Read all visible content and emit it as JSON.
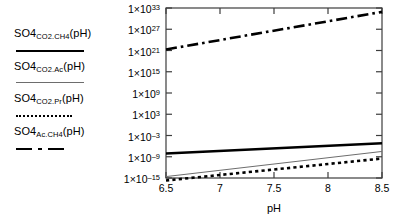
{
  "chart_data": {
    "type": "line",
    "title": "",
    "xlabel": "pH",
    "ylabel": "",
    "xlim": [
      6.5,
      8.5
    ],
    "ylim": [
      -15,
      33
    ],
    "yscale": "log",
    "grid": false,
    "legend_position": "left-outside",
    "x_ticks": [
      "6.5",
      "7",
      "7.5",
      "8",
      "8.5"
    ],
    "x_tick_values": [
      6.5,
      7,
      7.5,
      8,
      8.5
    ],
    "y_ticks": [
      {
        "mantissa": "1×10",
        "exponent": "33",
        "value": 33
      },
      {
        "mantissa": "1×10",
        "exponent": "27",
        "value": 27
      },
      {
        "mantissa": "1×10",
        "exponent": "21",
        "value": 21
      },
      {
        "mantissa": "1×10",
        "exponent": "15",
        "value": 15
      },
      {
        "mantissa": "1×10",
        "exponent": "9",
        "value": 9
      },
      {
        "mantissa": "1×10",
        "exponent": "3",
        "value": 3
      },
      {
        "mantissa": "1×10",
        "exponent": "–3",
        "value": -3
      },
      {
        "mantissa": "1×10",
        "exponent": "–9",
        "value": -9
      },
      {
        "mantissa": "1×10",
        "exponent": "–15",
        "value": -15
      }
    ],
    "series": [
      {
        "name": "SO4_CO2.CH4(pH)",
        "base": "SO4",
        "subscript": "CO2.CH4",
        "suffix": "(pH)",
        "style": "thick-solid",
        "color": "#000000",
        "x": [
          6.5,
          8.5
        ],
        "log10_y": [
          -8.1,
          -5.2
        ],
        "values": [
          7.9e-09,
          6.3e-06
        ]
      },
      {
        "name": "SO4_CO2.Ac(pH)",
        "base": "SO4",
        "subscript": "CO2.Ac",
        "suffix": "(pH)",
        "style": "thin-solid",
        "color": "#6d6d6d",
        "x": [
          6.5,
          8.5
        ],
        "log10_y": [
          -14.6,
          -7.5
        ],
        "values": [
          2.5e-15,
          3.2e-08
        ]
      },
      {
        "name": "SO4_CO2.Pr(pH)",
        "base": "SO4",
        "subscript": "CO2.Pr",
        "suffix": "(pH)",
        "style": "dotted",
        "color": "#000000",
        "x": [
          6.5,
          8.5
        ],
        "log10_y": [
          -15.7,
          -9.5
        ],
        "values": [
          2e-16,
          3.2e-10
        ]
      },
      {
        "name": "SO4_Ac.CH4(pH)",
        "base": "SO4",
        "subscript": "Ac.CH4",
        "suffix": "(pH)",
        "style": "dashdot",
        "color": "#000000",
        "x": [
          6.5,
          8.5
        ],
        "log10_y": [
          21.3,
          31.9
        ],
        "values": [
          2e+21,
          7.9e+31
        ]
      }
    ]
  },
  "legend": {
    "entries": [
      {
        "base": "SO4",
        "subscript": "CO2.CH4",
        "suffix": "(pH)",
        "style": "thick-solid"
      },
      {
        "base": "SO4",
        "subscript": "CO2.Ac",
        "suffix": "(pH)",
        "style": "thin-solid"
      },
      {
        "base": "SO4",
        "subscript": "CO2.Pr",
        "suffix": "(pH)",
        "style": "dotted"
      },
      {
        "base": "SO4",
        "subscript": "Ac.CH4",
        "suffix": "(pH)",
        "style": "dashdot"
      }
    ]
  },
  "axes": {
    "x_title": "pH"
  }
}
